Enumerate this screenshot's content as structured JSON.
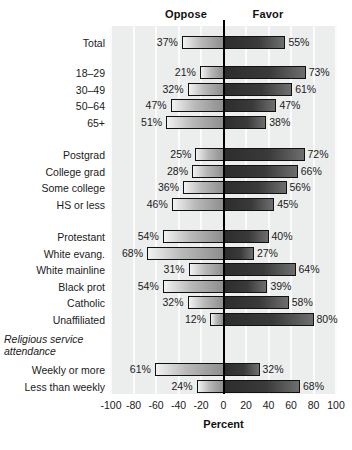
{
  "header": {
    "oppose_label": "Oppose",
    "favor_label": "Favor"
  },
  "axis": {
    "title": "Percent",
    "ticks": [
      "-100",
      "-80",
      "-60",
      "-40",
      "-20",
      "0",
      "20",
      "40",
      "60",
      "80",
      "100"
    ],
    "tick_values": [
      -100,
      -80,
      -60,
      -40,
      -20,
      0,
      20,
      40,
      60,
      80,
      100
    ],
    "xlim": [
      -100,
      100
    ]
  },
  "groups": [
    {
      "title": null,
      "rows": [
        "Total"
      ]
    },
    {
      "title": null,
      "rows": [
        "18–29",
        "30–49",
        "50–64",
        "65+"
      ]
    },
    {
      "title": null,
      "rows": [
        "Postgrad",
        "College grad",
        "Some college",
        "HS or less"
      ]
    },
    {
      "title": null,
      "rows": [
        "Protestant",
        "White evang.",
        "White mainline",
        "Black prot",
        "Catholic",
        "Unaffiliated"
      ]
    },
    {
      "title": "Religious service attendance",
      "rows": [
        "Weekly or more",
        "Less than weekly"
      ]
    }
  ],
  "chart_data": {
    "type": "bar",
    "orientation": "horizontal-diverging",
    "title": "",
    "xlabel": "Percent",
    "ylabel": "",
    "xlim": [
      -100,
      100
    ],
    "grid": true,
    "legend_position": "top",
    "series": [
      {
        "name": "Oppose",
        "side": "left",
        "values": [
          37,
          21,
          32,
          47,
          51,
          25,
          28,
          36,
          46,
          54,
          68,
          31,
          54,
          32,
          12,
          61,
          24
        ]
      },
      {
        "name": "Favor",
        "side": "right",
        "values": [
          55,
          73,
          61,
          47,
          38,
          72,
          66,
          56,
          45,
          40,
          27,
          64,
          39,
          58,
          80,
          32,
          68
        ]
      }
    ],
    "categories": [
      "Total",
      "18–29",
      "30–49",
      "50–64",
      "65+",
      "Postgrad",
      "College grad",
      "Some college",
      "HS or less",
      "Protestant",
      "White evang.",
      "White mainline",
      "Black prot",
      "Catholic",
      "Unaffiliated",
      "Weekly or more",
      "Less than weekly"
    ],
    "group_header": "Religious service attendance",
    "data_labels": [
      {
        "category": "Total",
        "oppose": "37%",
        "favor": "55%"
      },
      {
        "category": "18–29",
        "oppose": "21%",
        "favor": "73%"
      },
      {
        "category": "30–49",
        "oppose": "32%",
        "favor": "61%"
      },
      {
        "category": "50–64",
        "oppose": "47%",
        "favor": "47%"
      },
      {
        "category": "65+",
        "oppose": "51%",
        "favor": "38%"
      },
      {
        "category": "Postgrad",
        "oppose": "25%",
        "favor": "72%"
      },
      {
        "category": "College grad",
        "oppose": "28%",
        "favor": "66%"
      },
      {
        "category": "Some college",
        "oppose": "36%",
        "favor": "56%"
      },
      {
        "category": "HS or less",
        "oppose": "46%",
        "favor": "45%"
      },
      {
        "category": "Protestant",
        "oppose": "54%",
        "favor": "40%"
      },
      {
        "category": "White evang.",
        "oppose": "68%",
        "favor": "27%"
      },
      {
        "category": "White mainline",
        "oppose": "31%",
        "favor": "64%"
      },
      {
        "category": "Black prot",
        "oppose": "54%",
        "favor": "39%"
      },
      {
        "category": "Catholic",
        "oppose": "32%",
        "favor": "58%"
      },
      {
        "category": "Unaffiliated",
        "oppose": "12%",
        "favor": "80%"
      },
      {
        "category": "Weekly or more",
        "oppose": "61%",
        "favor": "32%"
      },
      {
        "category": "Less than weekly",
        "oppose": "24%",
        "favor": "68%"
      }
    ]
  },
  "layout": {
    "plot_left": 111,
    "plot_width": 225,
    "plot_top": 26,
    "plot_height": 368,
    "zero_x": 222,
    "row_tops": [
      36,
      66,
      82.5,
      99,
      115.5,
      148,
      164.5,
      181,
      197.5,
      230,
      246.5,
      263,
      279.5,
      296,
      312.5,
      363,
      379.5
    ],
    "group_title_top": 333,
    "colors": {
      "panel": "#eceded",
      "grid": "#fbfbfb",
      "zero_line": "#000000",
      "bar_border": "#111111",
      "text": "#1a1a1a"
    }
  }
}
